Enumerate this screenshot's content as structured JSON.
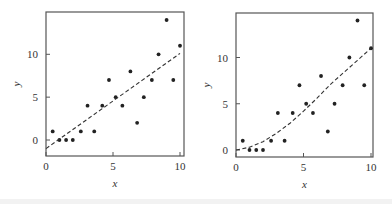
{
  "chart_data": [
    {
      "type": "scatter",
      "title": "",
      "xlabel": "x",
      "ylabel": "y",
      "xlim": [
        0,
        10
      ],
      "ylim": [
        -1.8,
        14.5
      ],
      "xticks": [
        "0",
        "5",
        "10"
      ],
      "yticks": [
        "0",
        "5",
        "10"
      ],
      "grid": false,
      "legend": null,
      "series": [
        {
          "name": "data",
          "x": [
            0.5,
            1,
            1.5,
            2,
            2.6,
            3.1,
            3.6,
            4.2,
            4.7,
            5.2,
            5.7,
            6.3,
            6.8,
            7.3,
            7.9,
            8.4,
            9.0,
            9.5,
            10
          ],
          "y": [
            1,
            0,
            0,
            0,
            1,
            4,
            1,
            4,
            7,
            5,
            4,
            8,
            2,
            5,
            7,
            10,
            14,
            7,
            11
          ]
        },
        {
          "name": "linear fit",
          "style": "dashed",
          "x": [
            0,
            10
          ],
          "y": [
            -1.0,
            10.1
          ]
        }
      ]
    },
    {
      "type": "scatter",
      "title": "",
      "xlabel": "x",
      "ylabel": "y",
      "xlim": [
        0,
        10
      ],
      "ylim": [
        -0.8,
        14.5
      ],
      "xticks": [
        "0",
        "5",
        "10"
      ],
      "yticks": [
        "0",
        "5",
        "10"
      ],
      "grid": false,
      "legend": null,
      "series": [
        {
          "name": "data",
          "x": [
            0.5,
            1,
            1.5,
            2,
            2.6,
            3.1,
            3.6,
            4.2,
            4.7,
            5.2,
            5.7,
            6.3,
            6.8,
            7.3,
            7.9,
            8.4,
            9.0,
            9.5,
            10
          ],
          "y": [
            1,
            0,
            0,
            0,
            1,
            4,
            1,
            4,
            7,
            5,
            4,
            8,
            2,
            5,
            7,
            10,
            14,
            7,
            11
          ]
        },
        {
          "name": "quadratic fit",
          "style": "dashed",
          "x": [
            0,
            1,
            2,
            3,
            4,
            5,
            6,
            7,
            8,
            9,
            10
          ],
          "y": [
            0,
            0.3,
            0.9,
            1.8,
            2.9,
            4.2,
            5.6,
            7.1,
            8.4,
            9.7,
            11.0
          ]
        }
      ]
    }
  ]
}
